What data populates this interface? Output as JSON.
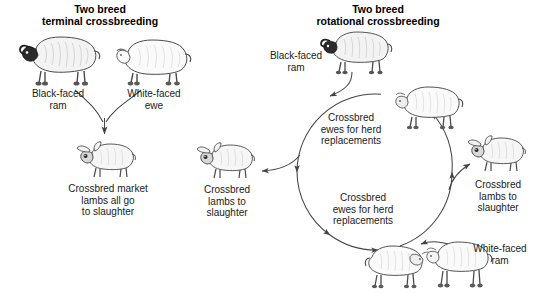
{
  "figure": {
    "width": 550,
    "height": 298,
    "background": "#ffffff",
    "line_color": "#444444",
    "text_color": "#1a1a1a"
  },
  "panels": [
    {
      "id": "terminal",
      "title": "Two breed\nterminal crossbreeding"
    },
    {
      "id": "rotational",
      "title": "Two breed\nrotational crossbreeding"
    }
  ],
  "terminal_panel": {
    "labels": {
      "black_faced_ram": "Black-faced\nram",
      "white_faced_ewe": "White-faced\newe",
      "market_lambs": "Crossbred market\nlambs all go\nto slaughter"
    },
    "animals": [
      {
        "name": "black-faced-ram",
        "type": "ram",
        "face": "black"
      },
      {
        "name": "white-faced-ewe",
        "type": "ewe",
        "face": "white"
      },
      {
        "name": "crossbred-market-lamb",
        "type": "lamb",
        "face": "dark"
      }
    ]
  },
  "rotational_panel": {
    "labels": {
      "black_faced_ram": "Black-faced\nram",
      "white_faced_ram": "White-faced\nram",
      "ewes_upper": "Crossbred\newes for herd\nreplacements",
      "ewes_lower": "Crossbred\newes for herd\nreplacements",
      "lambs_left": "Crossbred\nlambs to\nslaughter",
      "lambs_right": "Crossbred\nlambs to\nslaughter"
    },
    "animals": [
      {
        "name": "black-faced-ram",
        "type": "ram",
        "face": "black"
      },
      {
        "name": "crossbred-ewe-upper",
        "type": "ewe",
        "face": "white"
      },
      {
        "name": "crossbred-ewe-lower",
        "type": "ewe",
        "face": "white"
      },
      {
        "name": "white-faced-ram",
        "type": "ram",
        "face": "white"
      },
      {
        "name": "crossbred-lamb-left",
        "type": "lamb",
        "face": "dark"
      },
      {
        "name": "crossbred-lamb-right",
        "type": "lamb",
        "face": "dark"
      }
    ],
    "cycle": {
      "center_x": 375,
      "center_y": 172,
      "radius": 78,
      "direction": "clockwise"
    }
  }
}
